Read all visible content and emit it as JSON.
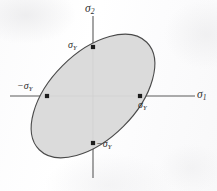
{
  "figure": {
    "background_color": "#fdfdfd"
  },
  "axes": {
    "horizontal": {
      "name": "sigma-1-axis",
      "label_symbol": "σ",
      "label_subscript": "1",
      "x_start": 10,
      "x_end": 195,
      "y": 96,
      "color": "#5a5a5a"
    },
    "vertical": {
      "name": "sigma-2-axis",
      "label_symbol": "σ",
      "label_subscript": "2",
      "y_start": 16,
      "y_end": 178,
      "x": 93,
      "color": "#5a5a5a"
    },
    "origin": {
      "x": 93,
      "y": 96
    }
  },
  "ellipse": {
    "name": "von-mises-yield-ellipse",
    "center_x": 93,
    "center_y": 96,
    "semi_major": 76,
    "semi_minor": 43,
    "rotation_deg": -45,
    "fill_color": "#d9d9d9",
    "stroke_color": "#4a4a4a",
    "stroke_width": 1.1
  },
  "markers": [
    {
      "name": "yield-point-top",
      "x": 93,
      "y": 47,
      "label": "σ",
      "subscript": "Y",
      "sign": ""
    },
    {
      "name": "yield-point-left",
      "x": 47,
      "y": 96,
      "label": "σ",
      "subscript": "Y",
      "sign": "−"
    },
    {
      "name": "yield-point-right",
      "x": 140,
      "y": 96,
      "label": "σ",
      "subscript": "Y",
      "sign": ""
    },
    {
      "name": "yield-point-bottom",
      "x": 93,
      "y": 143,
      "label": "σ",
      "subscript": "Y",
      "sign": "−"
    }
  ],
  "labels": {
    "sigma2_axis": {
      "sign": "",
      "symbol": "σ",
      "subscript": "2"
    },
    "sigma1_axis": {
      "sign": "",
      "symbol": "σ",
      "subscript": "1"
    },
    "top_point": {
      "sign": "",
      "symbol": "σ",
      "subscript": "Y"
    },
    "left_point": {
      "sign": "−",
      "symbol": "σ",
      "subscript": "Y"
    },
    "right_point": {
      "sign": "",
      "symbol": "σ",
      "subscript": "Y"
    },
    "bottom_point": {
      "sign": "−",
      "symbol": "σ",
      "subscript": "Y"
    }
  },
  "chart_data": {
    "type": "line",
    "xlabel": "σ₁",
    "ylabel": "σ₂",
    "grid": false,
    "legend": null,
    "curve": "ellipse",
    "equation": "σ₁² − σ₁σ₂ + σ₂² = σ_Y²",
    "rotation_deg": 45,
    "semi_axis_major_units": 1.4142,
    "semi_axis_minor_units": 0.8165,
    "annotated_points": [
      {
        "label": "σ_Y",
        "x": 1,
        "y": 0
      },
      {
        "label": "−σ_Y",
        "x": -1,
        "y": 0
      },
      {
        "label": "σ_Y",
        "x": 0,
        "y": 1
      },
      {
        "label": "−σ_Y",
        "x": 0,
        "y": -1
      }
    ],
    "xlim": [
      -1.6,
      1.6
    ],
    "ylim": [
      -1.6,
      1.6
    ]
  }
}
